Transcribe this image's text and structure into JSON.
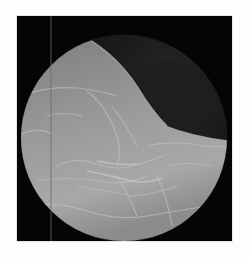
{
  "image": {
    "description": "Grayscale circular radiographic / endoscopic-style image with folded tissue texture on black background",
    "frame": {
      "x": 17,
      "y": 16,
      "width": 215,
      "height": 225,
      "background": "#050505"
    },
    "field_of_view": {
      "shape": "circle",
      "cx": 107,
      "cy": 122,
      "r": 103
    },
    "colors": {
      "page_background": "#fdfdfd",
      "frame_background": "#050505",
      "tissue_light": "#b8b8b8",
      "tissue_mid": "#8a8a8a",
      "tissue_dark": "#2a2a2a",
      "vertical_artifact_line": "#6a6a6a"
    },
    "artifacts": {
      "vertical_line_x": 34
    }
  }
}
